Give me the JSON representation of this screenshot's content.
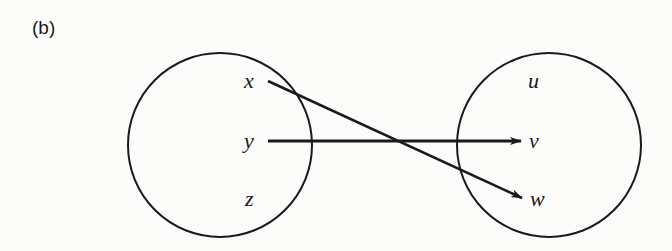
{
  "part_label": "(b)",
  "domain_set": {
    "elements": [
      {
        "label": "x",
        "x": 250,
        "y": 82
      },
      {
        "label": "y",
        "x": 250,
        "y": 141
      },
      {
        "label": "z",
        "x": 250,
        "y": 199
      }
    ]
  },
  "codomain_set": {
    "elements": [
      {
        "label": "u",
        "x": 532,
        "y": 82
      },
      {
        "label": "v",
        "x": 533,
        "y": 141
      },
      {
        "label": "w",
        "x": 535,
        "y": 199
      }
    ]
  },
  "mapping": [
    {
      "from": "x",
      "to": "w"
    },
    {
      "from": "y",
      "to": "v"
    }
  ],
  "colors": {
    "ink": "#1a1a1a",
    "paper": "#fcfcfa"
  }
}
